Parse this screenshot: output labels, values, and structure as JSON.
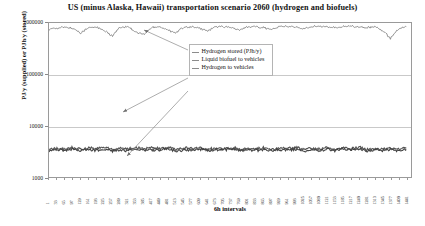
{
  "chart_data": {
    "type": "line",
    "title": "US (minus Alaska, Hawaii) transportation scenario 2060 (hydrogen and biofuels)",
    "xlabel": "6h intervals",
    "ylabel": "PJ/y (supplied) or PJh/y (stored)",
    "yscale": "log",
    "ylim": [
      1000,
      1000000
    ],
    "ytick_labels": [
      "1000000",
      "100000",
      "10000",
      "1000"
    ],
    "ytick_values": [
      1000000,
      100000,
      10000,
      1000
    ],
    "xlim": [
      1,
      1460
    ],
    "grid": true,
    "legend_position": "inside-upper-center",
    "x": [
      1,
      33,
      65,
      97,
      129,
      161,
      193,
      225,
      257,
      289,
      321,
      353,
      385,
      417,
      449,
      481,
      513,
      545,
      577,
      609,
      641,
      673,
      705,
      737,
      769,
      801,
      833,
      865,
      897,
      929,
      961,
      993,
      1025,
      1057,
      1089,
      1121,
      1153,
      1185,
      1217,
      1249,
      1281,
      1313,
      1345,
      1377,
      1409,
      1441
    ],
    "xtick_labels": [
      "1",
      "33",
      "65",
      "97",
      "129",
      "161",
      "193",
      "225",
      "257",
      "289",
      "321",
      "353",
      "385",
      "417",
      "449",
      "481",
      "513",
      "545",
      "577",
      "609",
      "641",
      "673",
      "705",
      "737",
      "769",
      "801",
      "833",
      "865",
      "897",
      "929",
      "961",
      "993",
      "1025",
      "1057",
      "1089",
      "1121",
      "1153",
      "1185",
      "1217",
      "1249",
      "1281",
      "1313",
      "1345",
      "1377",
      "1409",
      "1441"
    ],
    "series": [
      {
        "name": "Hydrogen stored (PJh/y)",
        "color": "#7a7a7a",
        "values": [
          760000,
          800000,
          820000,
          790000,
          640000,
          810000,
          830000,
          700000,
          560000,
          820000,
          840000,
          660000,
          600000,
          830000,
          845000,
          720000,
          640000,
          835000,
          850000,
          780000,
          700000,
          840000,
          855000,
          810000,
          720000,
          845000,
          860000,
          820000,
          740000,
          850000,
          862000,
          830000,
          760000,
          852000,
          864000,
          840000,
          800000,
          855000,
          866000,
          845000,
          810000,
          858000,
          700000,
          500000,
          760000,
          850000
        ]
      },
      {
        "name": "Liquid biofuel to vehicles",
        "color": "#555555",
        "values": [
          3400,
          3600,
          3500,
          3700,
          3450,
          3650,
          3550,
          3750,
          3400,
          3620,
          3520,
          3720,
          3480,
          3660,
          3560,
          3760,
          3420,
          3640,
          3540,
          3740,
          3460,
          3680,
          3580,
          3780,
          3440,
          3600,
          3500,
          3700,
          3470,
          3670,
          3570,
          3770,
          3430,
          3630,
          3530,
          3730,
          3490,
          3690,
          3590,
          3790,
          3410,
          3610,
          3510,
          3710,
          3450,
          3650
        ]
      },
      {
        "name": "Hydrogen to vehicles",
        "color": "#444444",
        "values": [
          3200,
          3380,
          3280,
          3480,
          3230,
          3430,
          3330,
          3530,
          3180,
          3400,
          3300,
          3500,
          3260,
          3440,
          3340,
          3540,
          3200,
          3420,
          3320,
          3520,
          3240,
          3460,
          3360,
          3560,
          3220,
          3380,
          3280,
          3480,
          3250,
          3450,
          3350,
          3550,
          3210,
          3410,
          3310,
          3510,
          3270,
          3470,
          3370,
          3570,
          3190,
          3390,
          3290,
          3490,
          3230,
          3430
        ]
      }
    ]
  },
  "legend": {
    "entries": [
      {
        "label": "Hydrogen stored (PJh/y)"
      },
      {
        "label": "Liquid biofuel to vehicles"
      },
      {
        "label": "Hydrogen to vehicles"
      }
    ]
  }
}
